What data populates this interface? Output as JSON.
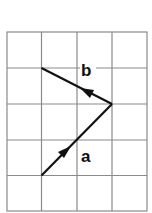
{
  "diagram": {
    "grid": {
      "columns": 4,
      "rows": 5,
      "line_color": "#8a8a8a"
    },
    "vectors": [
      {
        "name": "a",
        "label": "a",
        "from": [
          1,
          4
        ],
        "to": [
          3,
          2
        ]
      },
      {
        "name": "b",
        "label": "b",
        "from": [
          3,
          2
        ],
        "to": [
          1,
          1
        ]
      }
    ],
    "line_color": "#111111"
  }
}
